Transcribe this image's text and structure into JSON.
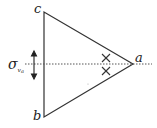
{
  "diagram": {
    "vertices": {
      "c": {
        "label": "c",
        "x": 44,
        "y": 12
      },
      "b": {
        "label": "b",
        "x": 44,
        "y": 117
      },
      "a": {
        "label": "a",
        "x": 133,
        "y": 64
      }
    },
    "mirror_plane": {
      "symbol": "σ",
      "subscript": "v",
      "subsubscript": "a",
      "y": 64
    },
    "markers": [
      {
        "type": "cross",
        "x": 106,
        "y": 58
      },
      {
        "type": "cross",
        "x": 106,
        "y": 71
      }
    ],
    "colors": {
      "stroke": "#333333",
      "dotted": "#555555"
    }
  }
}
